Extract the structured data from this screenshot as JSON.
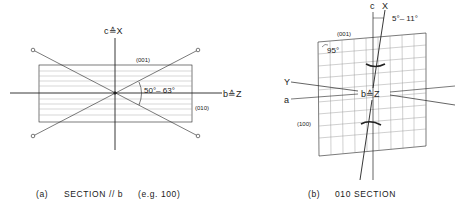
{
  "panel_a": {
    "axis_vertical_label": "c≙X",
    "axis_horizontal_label": "b≙Z",
    "plane_top_label": "(001)",
    "plane_side_label": "(010)",
    "angle_label": "50°– 63°",
    "caption_letter": "(a)",
    "caption_text": "SECTION // b",
    "caption_example": "(e.g. 100)"
  },
  "panel_b": {
    "axis_c_label": "c",
    "axis_x_label": "X",
    "tilt_angle_label": "5°– 11°",
    "plane_top_label": "(001)",
    "grid_angle_label": "95°",
    "axis_y_label": "Y",
    "axis_a_label": "a",
    "center_label": "b≙Z",
    "plane_side_label": "(100)",
    "caption_letter": "(b)",
    "caption_text": "010 SECTION"
  }
}
